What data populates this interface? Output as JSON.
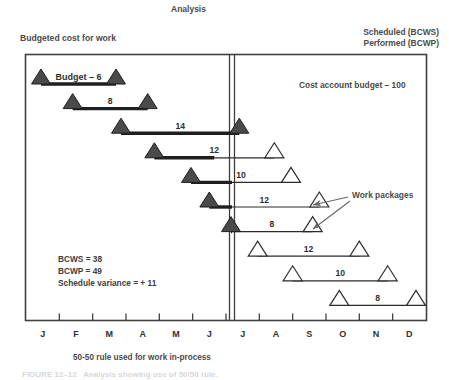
{
  "figure": {
    "title": "Analysis",
    "left_header": "Budgeted cost for work",
    "right_header_line1": "Scheduled (BCWS)",
    "right_header_line2": "Performed (BCWP)",
    "cost_account_note": "Cost account budget – 100",
    "work_packages_label": "Work packages",
    "first_bar_label": "Budget – 6",
    "bottom_caption": "50-50 rule used for work in-process",
    "footer_caption": "FIGURE 12–12   Analysis showing use of 50/50 rule."
  },
  "stats": {
    "bcws_label": "BCWS = 38",
    "bcwp_label": "BCWP = 49",
    "variance_label": "Schedule variance = + 11"
  },
  "axis": {
    "months": [
      "J",
      "F",
      "M",
      "A",
      "M",
      "J",
      "J",
      "A",
      "S",
      "O",
      "N",
      "D"
    ],
    "status_date_month_index": 6,
    "divider_label": "status-date"
  },
  "chart_data": {
    "type": "gantt",
    "title": "Analysis",
    "xlabel": "",
    "ylabel": "",
    "categories": [
      "J",
      "F",
      "M",
      "A",
      "M",
      "J",
      "J",
      "A",
      "S",
      "O",
      "N",
      "D"
    ],
    "cost_account_budget": 100,
    "bcws_total": 38,
    "bcwp_total": 49,
    "schedule_variance": 11,
    "earned_value_rule": "50-50",
    "work_packages": [
      {
        "budget": 6,
        "label": "Budget – 6",
        "start_month": 0.45,
        "end_month": 2.7,
        "percent_complete": 100,
        "start_marker": "filled",
        "end_marker": "filled",
        "bar": "thick"
      },
      {
        "budget": 8,
        "label": "8",
        "start_month": 1.4,
        "end_month": 3.65,
        "percent_complete": 100,
        "start_marker": "filled",
        "end_marker": "filled",
        "bar": "thick"
      },
      {
        "budget": 14,
        "label": "14",
        "start_month": 2.85,
        "end_month": 6.4,
        "percent_complete": 100,
        "start_marker": "filled",
        "end_marker": "filled",
        "bar": "thick"
      },
      {
        "budget": 12,
        "label": "12",
        "start_month": 3.85,
        "end_month": 7.45,
        "percent_complete": 50,
        "start_marker": "filled",
        "end_marker": "open",
        "bar": "split"
      },
      {
        "budget": 10,
        "label": "10",
        "start_month": 4.95,
        "end_month": 7.95,
        "percent_complete": 50,
        "start_marker": "filled",
        "end_marker": "open",
        "bar": "split"
      },
      {
        "budget": 12,
        "label": "12",
        "start_month": 5.5,
        "end_month": 8.8,
        "percent_complete": 50,
        "start_marker": "filled",
        "end_marker": "open",
        "bar": "split"
      },
      {
        "budget": 8,
        "label": "8",
        "start_month": 6.15,
        "end_month": 8.6,
        "percent_complete": 50,
        "start_marker": "filled",
        "end_marker": "open",
        "bar": "split"
      },
      {
        "budget": 12,
        "label": "12",
        "start_month": 6.95,
        "end_month": 10.0,
        "percent_complete": 0,
        "start_marker": "open",
        "end_marker": "open",
        "bar": "thin"
      },
      {
        "budget": 10,
        "label": "10",
        "start_month": 8.0,
        "end_month": 10.85,
        "percent_complete": 0,
        "start_marker": "open",
        "end_marker": "open",
        "bar": "thin"
      },
      {
        "budget": 8,
        "label": "8",
        "start_month": 9.4,
        "end_month": 11.7,
        "percent_complete": 0,
        "start_marker": "open",
        "end_marker": "open",
        "bar": "thin"
      }
    ],
    "annotations": [
      {
        "text": "Cost account budget – 100",
        "kind": "note"
      },
      {
        "text": "Work packages",
        "kind": "callout",
        "targets": 2
      }
    ],
    "grid": false,
    "legend": "none"
  }
}
